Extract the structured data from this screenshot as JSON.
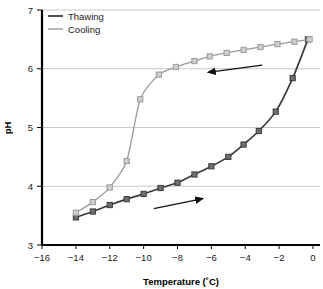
{
  "chart_data": {
    "type": "line",
    "title": "",
    "xlabel": "Temperature (˚C)",
    "ylabel": "pH",
    "xlim": [
      -16,
      0
    ],
    "ylim": [
      3,
      7
    ],
    "xticks": [
      -16,
      -14,
      -12,
      -10,
      -8,
      -6,
      -4,
      -2,
      0
    ],
    "xtick_labels": [
      "−16",
      "−14",
      "−12",
      "−10",
      "−8",
      "−6",
      "−4",
      "−2",
      "0"
    ],
    "yticks": [
      3,
      4,
      5,
      6,
      7
    ],
    "ytick_labels": [
      "3",
      "4",
      "5",
      "6",
      "7"
    ],
    "grid": "horizontal",
    "legend_position": "top-left",
    "marker": "square",
    "series": [
      {
        "name": "Thawing",
        "color": "#3a3a3a",
        "points": [
          [
            -14.0,
            3.47
          ],
          [
            -13.0,
            3.57
          ],
          [
            -12.0,
            3.68
          ],
          [
            -11.0,
            3.78
          ],
          [
            -10.0,
            3.87
          ],
          [
            -9.0,
            3.97
          ],
          [
            -8.0,
            4.06
          ],
          [
            -7.0,
            4.2
          ],
          [
            -6.0,
            4.34
          ],
          [
            -5.0,
            4.5
          ],
          [
            -4.1,
            4.71
          ],
          [
            -3.2,
            4.94
          ],
          [
            -2.2,
            5.27
          ],
          [
            -1.2,
            5.84
          ],
          [
            -0.3,
            6.5
          ]
        ]
      },
      {
        "name": "Cooling",
        "color": "#9a9a9a",
        "points": [
          [
            -14.0,
            3.55
          ],
          [
            -13.0,
            3.73
          ],
          [
            -12.0,
            3.98
          ],
          [
            -11.0,
            4.43
          ],
          [
            -10.2,
            5.48
          ],
          [
            -9.1,
            5.9
          ],
          [
            -8.1,
            6.03
          ],
          [
            -7.0,
            6.13
          ],
          [
            -6.1,
            6.21
          ],
          [
            -5.1,
            6.27
          ],
          [
            -4.1,
            6.32
          ],
          [
            -3.1,
            6.37
          ],
          [
            -2.1,
            6.42
          ],
          [
            -1.1,
            6.46
          ],
          [
            -0.2,
            6.5
          ]
        ]
      }
    ],
    "annotations": [
      {
        "name": "cooling-direction-arrow",
        "direction": "left",
        "x_from": -3.0,
        "y_from": 6.06,
        "x_to": -6.2,
        "y_to": 5.94
      },
      {
        "name": "thawing-direction-arrow",
        "direction": "right",
        "x_from": -9.4,
        "y_from": 3.62,
        "x_to": -6.5,
        "y_to": 3.79
      }
    ]
  },
  "legend": {
    "items": [
      {
        "label": "Thawing",
        "color": "#3a3a3a"
      },
      {
        "label": "Cooling",
        "color": "#9a9a9a"
      }
    ]
  },
  "colors": {
    "axis": "#000000",
    "grid": "#c9c9c9",
    "thawing": "#3a3a3a",
    "cooling": "#9a9a9a",
    "text": "#1a1a1a",
    "background": "#ffffff"
  }
}
